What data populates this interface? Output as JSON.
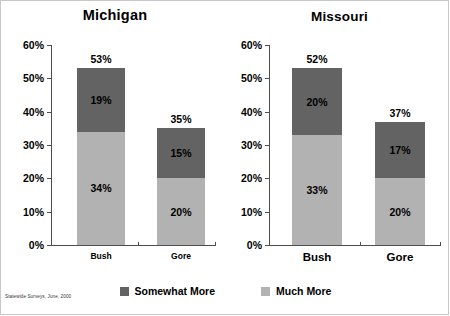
{
  "footnote": "Statewide Surveys, June, 2000",
  "legend": {
    "items": [
      {
        "label": "Somewhat More",
        "color": "#636363",
        "swatch_name": "legend-swatch-somewhat-more"
      },
      {
        "label": "Much More",
        "color": "#b2b2b2",
        "swatch_name": "legend-swatch-much-more"
      }
    ]
  },
  "chart_data": [
    {
      "type": "bar",
      "title": "Michigan",
      "stacked": true,
      "categories": [
        "Bush",
        "Gore"
      ],
      "series": [
        {
          "name": "Much More",
          "color": "#b2b2b2",
          "values": [
            34,
            20
          ],
          "labels": [
            "34%",
            "20%"
          ]
        },
        {
          "name": "Somewhat More",
          "color": "#636363",
          "values": [
            19,
            15
          ],
          "labels": [
            "19%",
            "15%"
          ]
        }
      ],
      "totals": [
        53,
        35
      ],
      "total_labels": [
        "53%",
        "35%"
      ],
      "xlabel": "",
      "ylabel": "",
      "ylim": [
        0,
        60
      ],
      "yticks": [
        0,
        10,
        20,
        30,
        40,
        50,
        60
      ],
      "ytick_labels": [
        "0%",
        "10%",
        "20%",
        "30%",
        "40%",
        "50%",
        "60%"
      ],
      "grid": false,
      "legend_position": "bottom"
    },
    {
      "type": "bar",
      "title": "Missouri",
      "stacked": true,
      "categories": [
        "Bush",
        "Gore"
      ],
      "series": [
        {
          "name": "Much More",
          "color": "#b2b2b2",
          "values": [
            33,
            20
          ],
          "labels": [
            "33%",
            "20%"
          ]
        },
        {
          "name": "Somewhat More",
          "color": "#636363",
          "values": [
            20,
            17
          ],
          "labels": [
            "20%",
            "17%"
          ]
        }
      ],
      "totals": [
        52,
        37
      ],
      "total_labels": [
        "52%",
        "37%"
      ],
      "xlabel": "",
      "ylabel": "",
      "ylim": [
        0,
        60
      ],
      "yticks": [
        0,
        10,
        20,
        30,
        40,
        50,
        60
      ],
      "ytick_labels": [
        "0%",
        "10%",
        "20%",
        "30%",
        "40%",
        "50%",
        "60%"
      ],
      "grid": false,
      "legend_position": "bottom"
    }
  ]
}
